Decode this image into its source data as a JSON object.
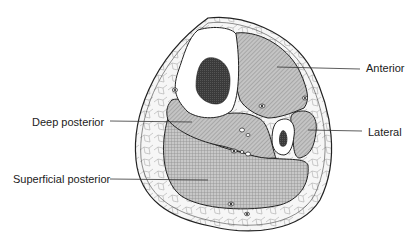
{
  "diagram": {
    "labels": [
      {
        "id": "anterior",
        "text": "Anterior",
        "x": 366,
        "y": 72
      },
      {
        "id": "lateral",
        "text": "Lateral",
        "x": 368,
        "y": 136
      },
      {
        "id": "deep-posterior",
        "text": "Deep posterior",
        "x": 32,
        "y": 126
      },
      {
        "id": "superficial-posterior",
        "text": "Superficial posterior",
        "x": 13,
        "y": 183
      }
    ],
    "colors": {
      "outline": "#222222",
      "muscle_fill": "#b9b9b9",
      "bone_marrow": "#3a3a3a",
      "fat_fill": "#f4f4f4",
      "background": "#ffffff"
    }
  }
}
